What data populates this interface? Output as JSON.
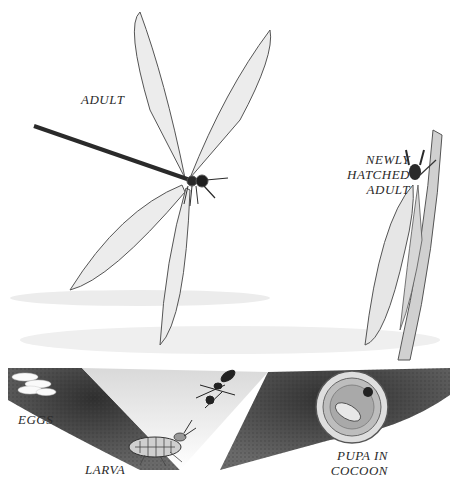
{
  "illustration": {
    "subject": "antlion life cycle",
    "labels": {
      "adult": "ADULT",
      "newly_hatched_line1": "NEWLY",
      "newly_hatched_line2": "HATCHED",
      "newly_hatched_line3": "ADULT",
      "eggs": "EGGS",
      "larva": "LARVA",
      "pupa_line1": "PUPA IN",
      "pupa_line2": "COCOON"
    },
    "colors": {
      "ink": "#2a2a2a",
      "soil": "#3a3a3a",
      "background": "#ffffff",
      "wing": "#8a8a8a"
    }
  }
}
